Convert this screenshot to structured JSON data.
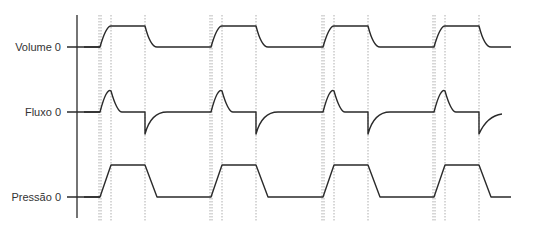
{
  "diagram": {
    "title": "",
    "signals": [
      {
        "key": "volume",
        "label": "Volume 0",
        "baseline_y": 47,
        "high_y": 26
      },
      {
        "key": "flow",
        "label": "Fluxo 0",
        "baseline_y": 112,
        "peak_y": 91,
        "trough_y": 134
      },
      {
        "key": "pressure",
        "label": "Pressão 0",
        "baseline_y": 197,
        "high_y": 165
      }
    ],
    "axis": {
      "x": 77,
      "y_top": 15,
      "y_bottom": 218
    },
    "cycles": {
      "count": 4,
      "starts_x": [
        100,
        211,
        323,
        434
      ],
      "rise_width": 11,
      "plateau_end_offset": 45,
      "fall_width": 12
    },
    "end_x": 511,
    "colors": {
      "line": "#2a2a2a",
      "guide": "#9a9a9a",
      "text": "#333333"
    }
  }
}
